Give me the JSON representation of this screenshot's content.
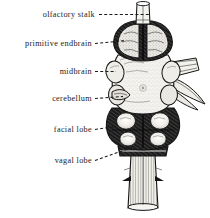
{
  "figure": {
    "background_color": "#ffffff",
    "ink_color": "#141414",
    "width": 210,
    "height": 218,
    "style": "engraving",
    "labels": [
      {
        "id": "olfactory-stalk",
        "text": "olfactory stalk",
        "text_x": 95,
        "text_y": 17,
        "anchor": "end",
        "leader": "M 99,14.5 L 150,14.5"
      },
      {
        "id": "primitive-endbrain",
        "text": "primitive endbrain",
        "text_x": 92,
        "text_y": 46,
        "anchor": "end",
        "leader": "M 95,43.5 L 125,40.5"
      },
      {
        "id": "midbrain",
        "text": "midbrain",
        "text_x": 92,
        "text_y": 74,
        "anchor": "end",
        "leader": "M 95,71.5 L 116,71.5"
      },
      {
        "id": "cerebellum",
        "text": "cerebellum",
        "text_x": 92,
        "text_y": 101,
        "anchor": "end",
        "leader": "M 95,98.5 L 123,96.5"
      },
      {
        "id": "facial-lobe",
        "text": "facial lobe",
        "text_x": 92,
        "text_y": 132,
        "anchor": "end",
        "leader": "M 95,129.5 L 116,126.5"
      },
      {
        "id": "vagal-lobe",
        "text": "vagal lobe",
        "text_x": 92,
        "text_y": 163,
        "anchor": "end",
        "leader": "M 95,160.5 L 132,147.5"
      }
    ],
    "structures": [
      {
        "id": "olfactory-stalk",
        "name": "olfactory stalk"
      },
      {
        "id": "primitive-endbrain",
        "name": "primitive endbrain"
      },
      {
        "id": "midbrain",
        "name": "midbrain"
      },
      {
        "id": "cerebellum",
        "name": "cerebellum"
      },
      {
        "id": "facial-lobe",
        "name": "facial lobe"
      },
      {
        "id": "vagal-lobe",
        "name": "vagal lobe"
      },
      {
        "id": "lateral-nerve",
        "name": "lateral nerve bundle"
      },
      {
        "id": "spinal-cord",
        "name": "spinal cord"
      }
    ]
  }
}
